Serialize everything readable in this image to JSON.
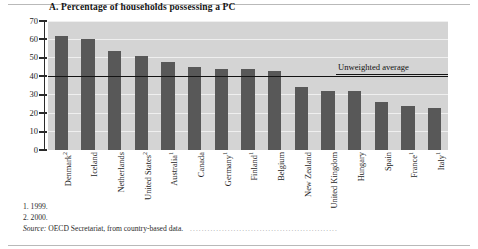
{
  "figure": {
    "title": "A. Percentage of households possessing a PC",
    "average_label": "Unweighted average",
    "notes": [
      "1. 1999.",
      "2. 2000."
    ],
    "source_keyword": "Source:",
    "source_text": "OECD Secretariat, from country-based data.",
    "leader_dots": "...................................................",
    "colors": {
      "bar": "#585858",
      "plot_background": "#d4d4d4",
      "gridline": "#efefef",
      "axis": "#2a2a2a",
      "average_line": "#141414"
    }
  },
  "chart_data": {
    "type": "bar",
    "title": "A. Percentage of households possessing a PC",
    "xlabel": "",
    "ylabel": "",
    "ylim": [
      0,
      70
    ],
    "yticks": [
      0,
      10,
      20,
      30,
      40,
      50,
      60,
      70
    ],
    "ytick_labels": [
      "0",
      "10",
      "20",
      "30",
      "40",
      "50",
      "60",
      "70"
    ],
    "grid": true,
    "legend": "none",
    "categories": [
      "Denmark2",
      "Iceland",
      "Netherlands",
      "United States2",
      "Australia1",
      "Canada",
      "Germany1",
      "Finland1",
      "Belgium",
      "New Zealand",
      "United Kingdom",
      "Hungary",
      "Spain",
      "France1",
      "Italy1"
    ],
    "category_labels": [
      {
        "name": "Denmark",
        "footnote": "2"
      },
      {
        "name": "Iceland",
        "footnote": ""
      },
      {
        "name": "Netherlands",
        "footnote": ""
      },
      {
        "name": "United States",
        "footnote": "2"
      },
      {
        "name": "Australia",
        "footnote": "1"
      },
      {
        "name": "Canada",
        "footnote": ""
      },
      {
        "name": "Germany",
        "footnote": "1"
      },
      {
        "name": "Finland",
        "footnote": "1"
      },
      {
        "name": "Belgium",
        "footnote": ""
      },
      {
        "name": "New Zealand",
        "footnote": ""
      },
      {
        "name": "United Kingdom",
        "footnote": ""
      },
      {
        "name": "Hungary",
        "footnote": ""
      },
      {
        "name": "Spain",
        "footnote": ""
      },
      {
        "name": "France",
        "footnote": "1"
      },
      {
        "name": "Italy",
        "footnote": "1"
      }
    ],
    "values": [
      62,
      60,
      54,
      51,
      48,
      45,
      44,
      44,
      43,
      34,
      32,
      32,
      26,
      24,
      23
    ],
    "annotations": [
      {
        "label": "Unweighted average",
        "type": "hline",
        "value": 40
      }
    ]
  }
}
